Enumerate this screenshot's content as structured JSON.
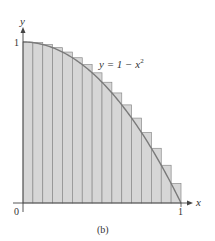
{
  "chart_data": {
    "type": "bar",
    "title": "",
    "subtitle": "(b)",
    "xlabel": "x",
    "ylabel": "y",
    "xlim": [
      0,
      1
    ],
    "ylim": [
      0,
      1
    ],
    "grid": false,
    "legend": null,
    "subintervals": 16,
    "categories": [
      "[0,1/16]",
      "[1/16,2/16]",
      "[2/16,3/16]",
      "[3/16,4/16]",
      "[4/16,5/16]",
      "[5/16,6/16]",
      "[6/16,7/16]",
      "[7/16,8/16]",
      "[8/16,9/16]",
      "[9/16,10/16]",
      "[10/16,11/16]",
      "[11/16,12/16]",
      "[12/16,13/16]",
      "[13/16,14/16]",
      "[14/16,15/16]",
      "[15/16,1]"
    ],
    "values": [
      1.0,
      0.9961,
      0.9844,
      0.9648,
      0.9375,
      0.9023,
      0.8594,
      0.8086,
      0.75,
      0.6836,
      0.6094,
      0.5273,
      0.4375,
      0.3398,
      0.2344,
      0.1211
    ],
    "curve": {
      "label": "y = 1 − x",
      "label_sup": "2",
      "function": "1 - x^2"
    },
    "tick_labels": {
      "x": [
        "0",
        "1"
      ],
      "y": [
        "1"
      ]
    },
    "annotations": [
      "y = 1 − x²"
    ],
    "colors": {
      "bar_fill": "#d6d6d6",
      "bar_stroke": "#8a8a8a",
      "curve": "#7a7a7a",
      "axis": "#444444"
    }
  },
  "labels": {
    "x_axis": "x",
    "y_axis": "y",
    "origin": "0",
    "x_one": "1",
    "y_one": "1",
    "caption": "(b)",
    "curve_main": "y = 1 − x",
    "curve_sup": "2"
  }
}
